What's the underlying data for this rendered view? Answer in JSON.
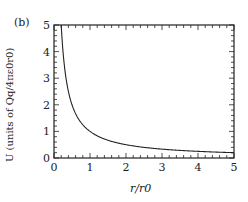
{
  "panel_label": "(b)",
  "chart_data": {
    "type": "line",
    "title": "",
    "xlabel": "r/r0",
    "ylabel": "U (units of Qq/4πε0r0)",
    "xlim": [
      0,
      5
    ],
    "ylim": [
      0,
      5
    ],
    "xticks": [
      "0",
      "1",
      "2",
      "3",
      "4",
      "5"
    ],
    "yticks": [
      "0",
      "1",
      "2",
      "3",
      "4",
      "5"
    ],
    "grid": false,
    "legend": null,
    "series": [
      {
        "name": "U = 1/(r/r0)",
        "x": [
          0.2,
          0.25,
          0.3,
          0.4,
          0.5,
          0.75,
          1,
          1.5,
          2,
          2.5,
          3,
          3.5,
          4,
          4.5,
          5
        ],
        "y": [
          5,
          4,
          3.33,
          2.5,
          2,
          1.33,
          1,
          0.67,
          0.5,
          0.4,
          0.33,
          0.29,
          0.25,
          0.22,
          0.2
        ]
      }
    ]
  }
}
